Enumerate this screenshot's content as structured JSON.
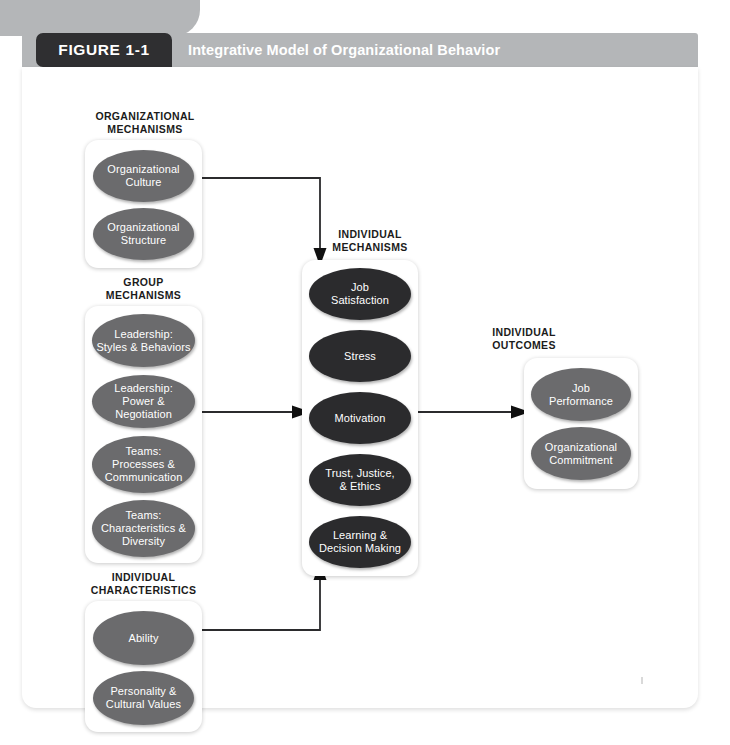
{
  "figure": {
    "tab_label": "FIGURE 1-1",
    "title": "Integrative Model of Organizational Behavior"
  },
  "diagram": {
    "type": "flow-diagram",
    "columns": [
      {
        "id": "organizational-mechanisms",
        "heading": "ORGANIZATIONAL\nMECHANISMS",
        "heading_line1": "ORGANIZATIONAL",
        "heading_line2": "MECHANISMS",
        "node_color": "#6b6b6d",
        "nodes": [
          {
            "label_line1": "Organizational",
            "label_line2": "Culture"
          },
          {
            "label_line1": "Organizational",
            "label_line2": "Structure"
          }
        ]
      },
      {
        "id": "group-mechanisms",
        "heading_line1": "GROUP",
        "heading_line2": "MECHANISMS",
        "node_color": "#6b6b6d",
        "nodes": [
          {
            "label_line1": "Leadership:",
            "label_line2": "Styles & Behaviors"
          },
          {
            "label_line1": "Leadership:",
            "label_line2": "Power & Negotiation"
          },
          {
            "label_line1": "Teams:",
            "label_line2": "Processes &",
            "label_line3": "Communication"
          },
          {
            "label_line1": "Teams:",
            "label_line2": "Characteristics &",
            "label_line3": "Diversity"
          }
        ]
      },
      {
        "id": "individual-characteristics",
        "heading_line1": "INDIVIDUAL",
        "heading_line2": "CHARACTERISTICS",
        "node_color": "#6b6b6d",
        "nodes": [
          {
            "label_line1": "Ability"
          },
          {
            "label_line1": "Personality &",
            "label_line2": "Cultural Values"
          }
        ]
      },
      {
        "id": "individual-mechanisms",
        "heading_line1": "INDIVIDUAL",
        "heading_line2": "MECHANISMS",
        "node_color": "#2b2b2d",
        "nodes": [
          {
            "label_line1": "Job",
            "label_line2": "Satisfaction"
          },
          {
            "label_line1": "Stress"
          },
          {
            "label_line1": "Motivation"
          },
          {
            "label_line1": "Trust, Justice,",
            "label_line2": "& Ethics"
          },
          {
            "label_line1": "Learning &",
            "label_line2": "Decision Making"
          }
        ]
      },
      {
        "id": "individual-outcomes",
        "heading_line1": "INDIVIDUAL",
        "heading_line2": "OUTCOMES",
        "node_color": "#6b6b6d",
        "nodes": [
          {
            "label_line1": "Job",
            "label_line2": "Performance"
          },
          {
            "label_line1": "Organizational",
            "label_line2": "Commitment"
          }
        ]
      }
    ],
    "connections": [
      {
        "from": "organizational-mechanisms",
        "to": "individual-mechanisms",
        "direction": "down"
      },
      {
        "from": "group-mechanisms",
        "to": "individual-mechanisms",
        "direction": "right"
      },
      {
        "from": "individual-characteristics",
        "to": "individual-mechanisms",
        "direction": "up"
      },
      {
        "from": "individual-mechanisms",
        "to": "individual-outcomes",
        "direction": "right"
      }
    ]
  },
  "colors": {
    "banner": "#b4b6b8",
    "tab": "#2f2f31",
    "node_gray": "#6b6b6d",
    "node_dark": "#2b2b2d",
    "connector": "#2b2b2d"
  }
}
